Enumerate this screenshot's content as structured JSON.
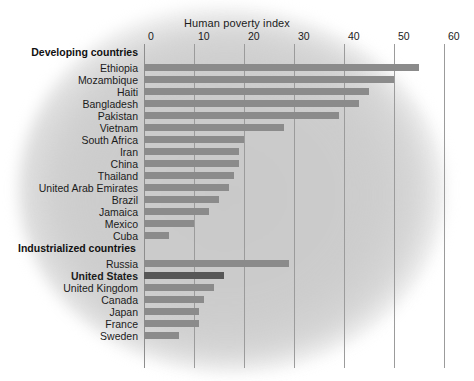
{
  "chart_data": {
    "type": "bar",
    "orientation": "horizontal",
    "title": "Human poverty index",
    "xlabel": "Human poverty index",
    "ylabel": "",
    "xlim": [
      0,
      60
    ],
    "xticks": [
      0,
      10,
      20,
      30,
      40,
      50,
      60
    ],
    "xtick_labels": [
      "0",
      "10",
      "20",
      "30",
      "40",
      "50",
      "60"
    ],
    "grid": true,
    "legend": false,
    "groups": [
      {
        "name": "Developing countries",
        "label": "Developing countries",
        "categories": [
          "Ethiopia",
          "Mozambique",
          "Haiti",
          "Bangladesh",
          "Pakistan",
          "Vietnam",
          "South Africa",
          "Iran",
          "China",
          "Thailand",
          "United Arab Emirates",
          "Brazil",
          "Jamaica",
          "Mexico",
          "Cuba"
        ],
        "values": [
          55,
          50,
          45,
          43,
          39,
          28,
          20,
          19,
          19,
          18,
          17,
          15,
          13,
          10,
          5
        ]
      },
      {
        "name": "Industrialized countries",
        "label": "Industrialized countries",
        "categories": [
          "Russia",
          "United States",
          "United Kingdom",
          "Canada",
          "Japan",
          "France",
          "Sweden"
        ],
        "values": [
          29,
          16,
          14,
          12,
          11,
          11,
          7
        ]
      }
    ],
    "highlight": {
      "category": "United States",
      "bold_label": true,
      "bar_color": "#575757"
    },
    "colors": {
      "bar": "#8b8b8b",
      "bar_highlight": "#575757",
      "gridline": "#9b9b9b",
      "text": "#1b1b1b",
      "background": "#cdcdcd",
      "page": "#ffffff"
    }
  },
  "axis": {
    "ticks": [
      {
        "label": "0",
        "value": 0
      },
      {
        "label": "10",
        "value": 10
      },
      {
        "label": "20",
        "value": 20
      },
      {
        "label": "30",
        "value": 30
      },
      {
        "label": "40",
        "value": 40
      },
      {
        "label": "50",
        "value": 50
      },
      {
        "label": "60",
        "value": 60
      }
    ]
  },
  "title": {
    "text": "Human poverty index"
  },
  "rows": [
    {
      "label": "Developing countries",
      "value": null,
      "type": "group"
    },
    {
      "label": "Ethiopia",
      "value": 55,
      "type": "bar"
    },
    {
      "label": "Mozambique",
      "value": 50,
      "type": "bar"
    },
    {
      "label": "Haiti",
      "value": 45,
      "type": "bar"
    },
    {
      "label": "Bangladesh",
      "value": 43,
      "type": "bar"
    },
    {
      "label": "Pakistan",
      "value": 39,
      "type": "bar"
    },
    {
      "label": "Vietnam",
      "value": 28,
      "type": "bar"
    },
    {
      "label": "South Africa",
      "value": 20,
      "type": "bar"
    },
    {
      "label": "Iran",
      "value": 19,
      "type": "bar"
    },
    {
      "label": "China",
      "value": 19,
      "type": "bar"
    },
    {
      "label": "Thailand",
      "value": 18,
      "type": "bar"
    },
    {
      "label": "United Arab Emirates",
      "value": 17,
      "type": "bar"
    },
    {
      "label": "Brazil",
      "value": 15,
      "type": "bar"
    },
    {
      "label": "Jamaica",
      "value": 13,
      "type": "bar"
    },
    {
      "label": "Mexico",
      "value": 10,
      "type": "bar"
    },
    {
      "label": "Cuba",
      "value": 5,
      "type": "bar"
    },
    {
      "label": "Industrialized countries",
      "value": null,
      "type": "group"
    },
    {
      "label": "Russia",
      "value": 29,
      "type": "bar"
    },
    {
      "label": "United States",
      "value": 16,
      "type": "bar",
      "emphasis": true
    },
    {
      "label": "United Kingdom",
      "value": 14,
      "type": "bar"
    },
    {
      "label": "Canada",
      "value": 12,
      "type": "bar"
    },
    {
      "label": "Japan",
      "value": 11,
      "type": "bar"
    },
    {
      "label": "France",
      "value": 11,
      "type": "bar"
    },
    {
      "label": "Sweden",
      "value": 7,
      "type": "bar"
    }
  ]
}
